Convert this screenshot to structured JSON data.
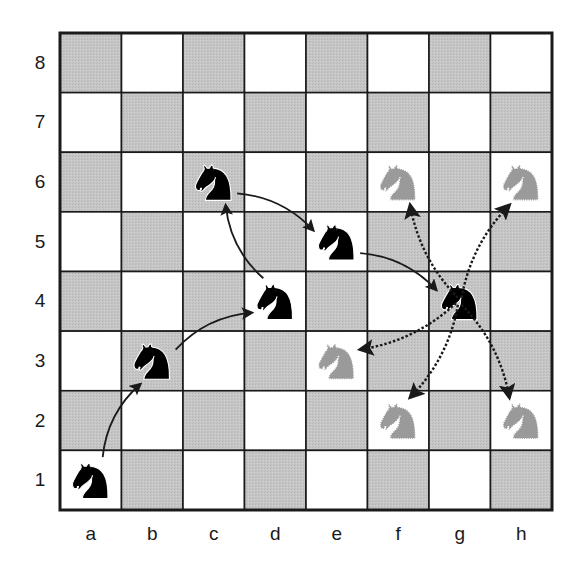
{
  "diagram": {
    "title": "",
    "files": [
      "a",
      "b",
      "c",
      "d",
      "e",
      "f",
      "g",
      "h"
    ],
    "ranks": [
      "8",
      "7",
      "6",
      "5",
      "4",
      "3",
      "2",
      "1"
    ],
    "colors": {
      "light_square": "#ffffff",
      "dark_square": "#c4c4c4",
      "grid_line": "#1a1a1a",
      "knight_solid": "#000000",
      "knight_ghost": "#9a9a9a",
      "arrow": "#1a1a1a"
    },
    "knights_solid": [
      "a1",
      "b3",
      "d4",
      "c6",
      "e5",
      "g4"
    ],
    "knights_ghost": [
      "f6",
      "h6",
      "e3",
      "f2",
      "h2"
    ],
    "path_arrows": [
      {
        "from": "a1",
        "to": "b3",
        "style": "solid"
      },
      {
        "from": "b3",
        "to": "d4",
        "style": "solid"
      },
      {
        "from": "d4",
        "to": "c6",
        "style": "solid"
      },
      {
        "from": "c6",
        "to": "e5",
        "style": "solid"
      },
      {
        "from": "e5",
        "to": "g4",
        "style": "solid"
      }
    ],
    "option_arrows": [
      {
        "from": "g4",
        "to": "f6",
        "style": "dotted"
      },
      {
        "from": "g4",
        "to": "h6",
        "style": "dotted"
      },
      {
        "from": "g4",
        "to": "e3",
        "style": "dotted"
      },
      {
        "from": "g4",
        "to": "f2",
        "style": "dotted"
      },
      {
        "from": "g4",
        "to": "h2",
        "style": "dotted"
      }
    ]
  }
}
